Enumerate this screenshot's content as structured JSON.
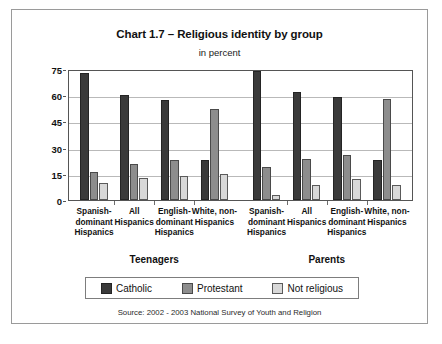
{
  "chart_data": {
    "type": "bar",
    "title": "Chart 1.7 – Religious identity by group",
    "subtitle": "in percent",
    "xlabel": "",
    "ylabel": "",
    "ylim": [
      0,
      75
    ],
    "yticks": [
      0,
      15,
      30,
      45,
      60,
      75
    ],
    "grid": true,
    "legend_position": "bottom",
    "source": "Source: 2002 - 2003 National Survey of Youth and Religion",
    "panels": [
      {
        "name": "Teenagers",
        "categories": [
          "Spanish-dominant Hispanics",
          "All Hispanics",
          "English-dominant Hispanics",
          "White, non-Hispanics"
        ],
        "series": [
          {
            "name": "Catholic",
            "values": [
              74,
              61,
              58,
              23
            ]
          },
          {
            "name": "Protestant",
            "values": [
              16,
              21,
              23,
              53
            ]
          },
          {
            "name": "Not religious",
            "values": [
              10,
              13,
              14,
              15
            ]
          }
        ]
      },
      {
        "name": "Parents",
        "categories": [
          "Spanish-dominant Hispanics",
          "All Hispanics",
          "English-dominant Hispanics",
          "White, non-Hispanics"
        ],
        "series": [
          {
            "name": "Catholic",
            "values": [
              75,
              63,
              60,
              23
            ]
          },
          {
            "name": "Protestant",
            "values": [
              19,
              24,
              26,
              59
            ]
          },
          {
            "name": "Not religious",
            "values": [
              3,
              9,
              12,
              9
            ]
          }
        ]
      }
    ],
    "colors": {
      "catholic": "#3a3a3a",
      "protestant": "#8d8d8d",
      "not_religious": "#d8d8d8"
    }
  },
  "category_lines": {
    "spanish": [
      "Spanish-",
      "dominant",
      "Hispanics"
    ],
    "all": [
      "All",
      "Hispanics"
    ],
    "english": [
      "English-",
      "dominant",
      "Hispanics"
    ],
    "white": [
      "White, non-",
      "Hispanics"
    ]
  },
  "legend": {
    "items": [
      {
        "label": "Catholic",
        "key": "catholic"
      },
      {
        "label": "Protestant",
        "key": "protestant"
      },
      {
        "label": "Not religious",
        "key": "notreligious"
      }
    ]
  }
}
